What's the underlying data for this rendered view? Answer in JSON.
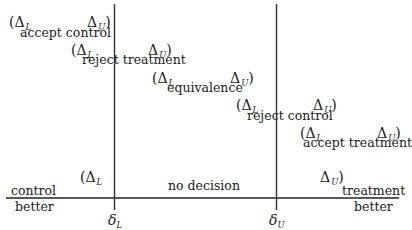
{
  "diagram": {
    "axis": {
      "left_label_top": "control",
      "left_label_bottom": "better",
      "right_label_top": "treatment",
      "right_label_bottom": "better"
    },
    "thresholds": {
      "lower": {
        "symbol": "δ",
        "sub": "L"
      },
      "upper": {
        "symbol": "δ",
        "sub": "U"
      }
    },
    "intervals": [
      {
        "open": "(Δ",
        "open_sub": "L",
        "close": "Δ",
        "close_sub": "U",
        "close_paren": ")",
        "label": "accept control"
      },
      {
        "open": "(Δ",
        "open_sub": "L",
        "close": "Δ",
        "close_sub": "U",
        "close_paren": ")",
        "label": "reject treatment"
      },
      {
        "open": "(Δ",
        "open_sub": "L",
        "close": "Δ",
        "close_sub": "U",
        "close_paren": ")",
        "label": "equivalence"
      },
      {
        "open": "(Δ",
        "open_sub": "L",
        "close": "Δ",
        "close_sub": "U",
        "close_paren": ")",
        "label": "reject control"
      },
      {
        "open": "(Δ",
        "open_sub": "L",
        "close": "Δ",
        "close_sub": "U",
        "close_paren": ")",
        "label": "accept treatment"
      },
      {
        "open": "(Δ",
        "open_sub": "L",
        "close": "Δ",
        "close_sub": "U",
        "close_paren": ")",
        "label": "no decision"
      }
    ],
    "colors": {
      "line": "#222222",
      "text": "#1a1a1a",
      "background": "#ffffff"
    }
  }
}
